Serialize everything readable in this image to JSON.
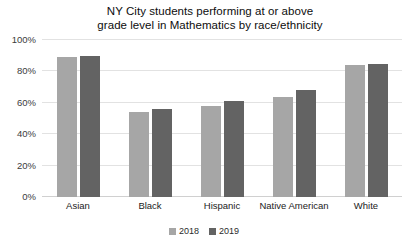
{
  "chart_data": {
    "type": "bar",
    "title": "NY City students performing at or above grade level in Mathematics by race/ethnicity",
    "title_line1": "NY City students performing at or above",
    "title_line2": "grade level in Mathematics by race/ethnicity",
    "xlabel": "",
    "ylabel": "",
    "categories": [
      "Asian",
      "Black",
      "Hispanic",
      "Native American",
      "White"
    ],
    "series": [
      {
        "name": "2018",
        "color": "#a6a6a6",
        "values": [
          89,
          54,
          58,
          64,
          84
        ]
      },
      {
        "name": "2019",
        "color": "#636363",
        "values": [
          90,
          56,
          61,
          68,
          85
        ]
      }
    ],
    "ylim": [
      0,
      100
    ],
    "y_ticks": [
      0,
      20,
      40,
      60,
      80,
      100
    ],
    "y_tick_labels": [
      "0%",
      "20%",
      "40%",
      "60%",
      "80%",
      "100%"
    ],
    "grid": true,
    "legend_position": "bottom"
  }
}
